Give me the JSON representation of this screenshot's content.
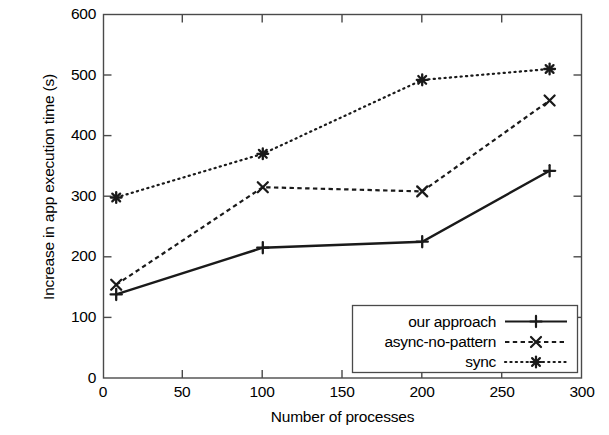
{
  "chart_data": {
    "type": "line",
    "title": "",
    "xlabel": "Number of processes",
    "ylabel": "Increase in app execution time (s)",
    "xlim": [
      0,
      300
    ],
    "ylim": [
      0,
      600
    ],
    "xticks": [
      "0",
      "50",
      "100",
      "150",
      "200",
      "250",
      "300"
    ],
    "yticks": [
      "0",
      "100",
      "200",
      "300",
      "400",
      "500",
      "600"
    ],
    "grid": false,
    "legend_position": "lower right",
    "series": [
      {
        "name": "our approach",
        "marker": "plus",
        "linestyle": "solid",
        "color": "#1a1a1a",
        "x": [
          8,
          100,
          200,
          280
        ],
        "values": [
          138,
          215,
          225,
          342
        ]
      },
      {
        "name": "async-no-pattern",
        "marker": "cross",
        "linestyle": "dashed",
        "color": "#1a1a1a",
        "x": [
          8,
          100,
          200,
          280
        ],
        "values": [
          154,
          315,
          308,
          458
        ]
      },
      {
        "name": "sync",
        "marker": "asterisk",
        "linestyle": "dotted",
        "color": "#1a1a1a",
        "x": [
          8,
          100,
          200,
          280
        ],
        "values": [
          298,
          370,
          492,
          510
        ]
      }
    ]
  },
  "axis": {
    "y": {
      "t0": "0",
      "t1": "100",
      "t2": "200",
      "t3": "300",
      "t4": "400",
      "t5": "500",
      "t6": "600",
      "title": "Increase in app execution time (s)"
    },
    "x": {
      "t0": "0",
      "t1": "50",
      "t2": "100",
      "t3": "150",
      "t4": "200",
      "t5": "250",
      "t6": "300",
      "title": "Number of processes"
    }
  },
  "legend": {
    "entry0": "our approach",
    "entry1": "async-no-pattern",
    "entry2": "sync"
  }
}
